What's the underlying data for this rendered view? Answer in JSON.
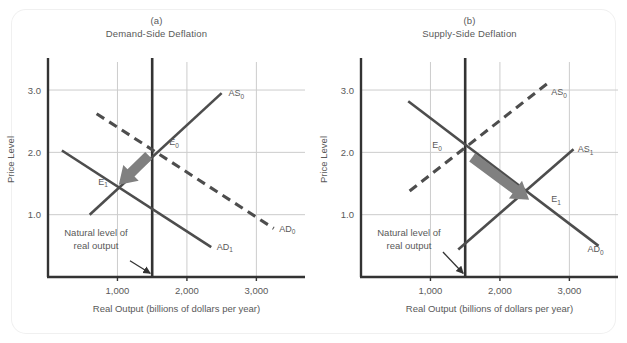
{
  "figure": {
    "background": "#ffffff",
    "panel_count": 2
  },
  "style": {
    "curve_color": "#4d4d4d",
    "axis_color": "#333333",
    "grid_color": "#cccccc",
    "arrow_color": "#808080",
    "text_color": "#595959",
    "natural_line_color": "#333333"
  },
  "chart_data": [
    {
      "type": "line",
      "panel_letter": "(a)",
      "title": "Demand-Side Deflation",
      "xlabel": "Real Output  (billions of dollars per year)",
      "ylabel": "Price Level",
      "xlim": [
        0,
        3700
      ],
      "ylim": [
        0,
        3.45
      ],
      "xticks": [
        1000,
        2000,
        3000
      ],
      "xtick_labels": [
        "1,000",
        "2,000",
        "3,000"
      ],
      "yticks": [
        1.0,
        2.0,
        3.0
      ],
      "ytick_labels": [
        "1.0",
        "2.0",
        "3.0"
      ],
      "grid": true,
      "natural_output": 1500,
      "series": [
        {
          "name": "AS0",
          "label": "AS",
          "sub": "0",
          "style": "solid",
          "points": [
            [
              600,
              1.0
            ],
            [
              2500,
              2.95
            ]
          ],
          "label_at": [
            2600,
            2.9
          ]
        },
        {
          "name": "AD0",
          "label": "AD",
          "sub": "0",
          "style": "dashed",
          "points": [
            [
              700,
              2.62
            ],
            [
              3250,
              0.78
            ]
          ],
          "label_at": [
            3330,
            0.73
          ]
        },
        {
          "name": "AD1",
          "label": "AD",
          "sub": "1",
          "style": "solid",
          "points": [
            [
              200,
              2.03
            ],
            [
              2350,
              0.48
            ]
          ],
          "label_at": [
            2430,
            0.44
          ]
        }
      ],
      "equilibria": [
        {
          "name": "E0",
          "label": "E",
          "sub": "0",
          "x": 1500,
          "y": 2.0,
          "label_dx": 17,
          "label_dy": -7
        },
        {
          "name": "E1",
          "label": "E",
          "sub": "1",
          "x": 1010,
          "y": 1.45,
          "label_dx": -20,
          "label_dy": -2
        }
      ],
      "shift_arrow": {
        "from": [
          1450,
          1.95
        ],
        "to": [
          1020,
          1.48
        ]
      },
      "annotation": {
        "lines": [
          "Natural level of",
          "real output"
        ],
        "text_at": [
          690,
          0.66
        ],
        "arrow_from": [
          1180,
          0.26
        ],
        "arrow_to": [
          1470,
          0.06
        ]
      }
    },
    {
      "type": "line",
      "panel_letter": "(b)",
      "title": "Supply-Side Deflation",
      "xlabel": "Real Output (billions of dollars per year)",
      "ylabel": "Price Level",
      "xlim": [
        0,
        3700
      ],
      "ylim": [
        0,
        3.45
      ],
      "xticks": [
        1000,
        2000,
        3000
      ],
      "xtick_labels": [
        "1,000",
        "2,000",
        "3,000"
      ],
      "yticks": [
        1.0,
        2.0,
        3.0
      ],
      "ytick_labels": [
        "1.0",
        "2.0",
        "3.0"
      ],
      "grid": true,
      "natural_output": 1500,
      "series": [
        {
          "name": "AS0",
          "label": "AS",
          "sub": "0",
          "style": "dashed",
          "points": [
            [
              700,
              1.38
            ],
            [
              2700,
              3.12
            ]
          ],
          "label_at": [
            2740,
            2.92
          ]
        },
        {
          "name": "AS1",
          "label": "AS",
          "sub": "1",
          "style": "solid",
          "points": [
            [
              1400,
              0.44
            ],
            [
              3060,
              2.05
            ]
          ],
          "label_at": [
            3120,
            2.0
          ]
        },
        {
          "name": "AD0",
          "label": "AD",
          "sub": "0",
          "style": "solid",
          "points": [
            [
              680,
              2.82
            ],
            [
              3420,
              0.5
            ]
          ],
          "label_at": [
            3260,
            0.4
          ]
        }
      ],
      "equilibria": [
        {
          "name": "E0",
          "label": "E",
          "sub": "0",
          "x": 1500,
          "y": 2.0,
          "label_dx": -33,
          "label_dy": -4
        },
        {
          "name": "E1",
          "label": "E",
          "sub": "1",
          "x": 2450,
          "y": 1.25,
          "label_dx": 20,
          "label_dy": 3
        }
      ],
      "shift_arrow": {
        "from": [
          1600,
          1.92
        ],
        "to": [
          2420,
          1.24
        ]
      },
      "annotation": {
        "lines": [
          "Natural level of",
          "real output"
        ],
        "text_at": [
          690,
          0.66
        ],
        "arrow_from": [
          1180,
          0.4
        ],
        "arrow_to": [
          1470,
          0.06
        ]
      }
    }
  ]
}
